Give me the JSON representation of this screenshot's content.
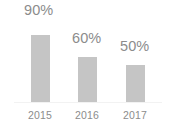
{
  "chart_data": {
    "type": "bar",
    "title": "",
    "subtitle": "",
    "xlabel": "",
    "ylabel": "",
    "grid": false,
    "legend": "none",
    "ylim": [
      0,
      100
    ],
    "categories": [
      "2015",
      "2016",
      "2017"
    ],
    "values": [
      90,
      60,
      50
    ],
    "value_labels": [
      "90%",
      "60%",
      "50%"
    ],
    "series": [
      {
        "name": "",
        "values": [
          90,
          60,
          50
        ]
      }
    ],
    "colors": {
      "bar_fill": "#c5c5c5",
      "text": "#8c8c8c",
      "background": "#ffffff",
      "baseline": "#f2f2f2"
    }
  }
}
